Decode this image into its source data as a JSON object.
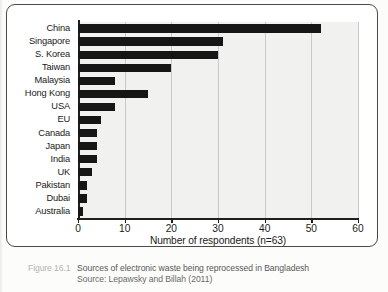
{
  "figure": {
    "number": "Figure 16.1",
    "title": "Sources of electronic waste being reprocessed in Bangladesh",
    "source": "Source: Lepawsky and Billah (2011)"
  },
  "chart_data": {
    "type": "bar",
    "orientation": "horizontal",
    "title": "",
    "xlabel": "Number of respondents (n=63)",
    "ylabel": "",
    "xlim": [
      0,
      60
    ],
    "xticks": [
      0,
      10,
      20,
      30,
      40,
      50,
      60
    ],
    "grid": true,
    "legend": "none",
    "bar_color": "#161616",
    "plot_background": "#f1f1f0",
    "categories": [
      "China",
      "Singapore",
      "S. Korea",
      "Taiwan",
      "Malaysia",
      "Hong Kong",
      "USA",
      "EU",
      "Canada",
      "Japan",
      "India",
      "UK",
      "Pakistan",
      "Dubai",
      "Australia"
    ],
    "values": [
      52,
      31,
      30,
      20,
      8,
      15,
      8,
      5,
      4,
      4,
      4,
      3,
      2,
      2,
      1
    ]
  }
}
